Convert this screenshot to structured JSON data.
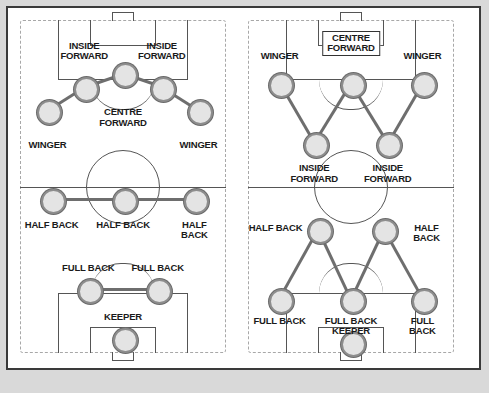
{
  "figure": {
    "background_color": "#d9d9d9",
    "frame_color": "#3a3a3a",
    "player_fill": "#e4e4e4",
    "player_ring": "#8d8d8d",
    "link_color": "#6e6e6e",
    "pitch_line_color": "#555555",
    "pitch_border_color": "#a8a8a8"
  },
  "diagrams": [
    {
      "id": "pyramid",
      "name": "left-formation",
      "players": [
        {
          "name": "winger-left",
          "label": "WINGER",
          "x": 13,
          "y": 27,
          "label_x": 13,
          "label_y": 36,
          "boxed": false
        },
        {
          "name": "inside-forward-left",
          "label": "INSIDE\nFORWARD",
          "x": 31,
          "y": 20,
          "label_x": 31,
          "label_y": 6,
          "boxed": false
        },
        {
          "name": "centre-forward",
          "label": "CENTRE\nFORWARD",
          "x": 50,
          "y": 16,
          "label_x": 50,
          "label_y": 26,
          "boxed": false
        },
        {
          "name": "inside-forward-right",
          "label": "INSIDE\nFORWARD",
          "x": 69,
          "y": 20,
          "label_x": 69,
          "label_y": 6,
          "boxed": false
        },
        {
          "name": "winger-right",
          "label": "WINGER",
          "x": 87,
          "y": 27,
          "label_x": 87,
          "label_y": 36,
          "boxed": false
        },
        {
          "name": "half-back-left",
          "label": "HALF BACK",
          "x": 15,
          "y": 54,
          "label_x": 15,
          "label_y": 60,
          "boxed": false
        },
        {
          "name": "half-back-centre",
          "label": "HALF BACK",
          "x": 50,
          "y": 54,
          "label_x": 50,
          "label_y": 60,
          "boxed": false
        },
        {
          "name": "half-back-right",
          "label": "HALF BACK",
          "x": 85,
          "y": 54,
          "label_x": 85,
          "label_y": 60,
          "boxed": false
        },
        {
          "name": "full-back-left",
          "label": "FULL BACK",
          "x": 33,
          "y": 81,
          "label_x": 33,
          "label_y": 73,
          "boxed": false
        },
        {
          "name": "full-back-right",
          "label": "FULL BACK",
          "x": 67,
          "y": 81,
          "label_x": 67,
          "label_y": 73,
          "boxed": false
        },
        {
          "name": "keeper",
          "label": "KEEPER",
          "x": 50,
          "y": 96,
          "label_x": 50,
          "label_y": 88,
          "boxed": false
        }
      ],
      "links": [
        [
          "winger-left",
          "inside-forward-left"
        ],
        [
          "inside-forward-left",
          "centre-forward"
        ],
        [
          "centre-forward",
          "inside-forward-right"
        ],
        [
          "inside-forward-right",
          "winger-right"
        ],
        [
          "half-back-left",
          "half-back-centre"
        ],
        [
          "half-back-centre",
          "half-back-right"
        ],
        [
          "full-back-left",
          "full-back-right"
        ]
      ]
    },
    {
      "id": "wm",
      "name": "right-formation",
      "players": [
        {
          "name": "winger-left",
          "label": "WINGER",
          "x": 15,
          "y": 19,
          "label_x": 15,
          "label_y": 9,
          "boxed": false
        },
        {
          "name": "centre-forward",
          "label": "CENTRE\nFORWARD",
          "x": 50,
          "y": 19,
          "label_x": 50,
          "label_y": 3,
          "boxed": true
        },
        {
          "name": "winger-right",
          "label": "WINGER",
          "x": 85,
          "y": 19,
          "label_x": 85,
          "label_y": 9,
          "boxed": false
        },
        {
          "name": "inside-forward-left",
          "label": "INSIDE\nFORWARD",
          "x": 32,
          "y": 37,
          "label_x": 32,
          "label_y": 43,
          "boxed": false
        },
        {
          "name": "inside-forward-right",
          "label": "INSIDE\nFORWARD",
          "x": 68,
          "y": 37,
          "label_x": 68,
          "label_y": 43,
          "boxed": false
        },
        {
          "name": "half-back-left",
          "label": "HALF BACK",
          "x": 34,
          "y": 63,
          "label_x": 13,
          "label_y": 61,
          "boxed": false
        },
        {
          "name": "half-back-right",
          "label": "HALF BACK",
          "x": 66,
          "y": 63,
          "label_x": 87,
          "label_y": 61,
          "boxed": false
        },
        {
          "name": "full-back-left",
          "label": "FULL BACK",
          "x": 15,
          "y": 84,
          "label_x": 15,
          "label_y": 89,
          "boxed": false
        },
        {
          "name": "full-back-centre",
          "label": "FULL BACK",
          "x": 50,
          "y": 84,
          "label_x": 50,
          "label_y": 89,
          "boxed": false
        },
        {
          "name": "full-back-right",
          "label": "FULL BACK",
          "x": 85,
          "y": 84,
          "label_x": 85,
          "label_y": 89,
          "boxed": false
        },
        {
          "name": "keeper",
          "label": "KEEPER",
          "x": 50,
          "y": 97,
          "label_x": 50,
          "label_y": 92,
          "boxed": false
        }
      ],
      "links": [
        [
          "winger-left",
          "inside-forward-left"
        ],
        [
          "inside-forward-left",
          "centre-forward"
        ],
        [
          "centre-forward",
          "inside-forward-right"
        ],
        [
          "inside-forward-right",
          "winger-right"
        ],
        [
          "half-back-left",
          "full-back-left"
        ],
        [
          "half-back-left",
          "full-back-centre"
        ],
        [
          "half-back-right",
          "full-back-centre"
        ],
        [
          "half-back-right",
          "full-back-right"
        ]
      ]
    }
  ]
}
